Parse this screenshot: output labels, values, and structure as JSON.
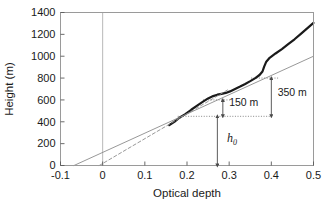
{
  "chart_data": {
    "type": "line",
    "title": "",
    "xlabel": "Optical depth",
    "ylabel": "Height (m)",
    "xlim": [
      -0.1,
      0.5
    ],
    "ylim": [
      0,
      1400
    ],
    "xticks": [
      -0.1,
      0,
      0.1,
      0.2,
      0.3,
      0.4,
      0.5
    ],
    "xtick_labels": [
      "-0.1",
      "0",
      "0.1",
      "0.2",
      "0.3",
      "0.4",
      "0.5"
    ],
    "yticks": [
      0,
      200,
      400,
      600,
      800,
      1000,
      1200,
      1400
    ],
    "ytick_labels": [
      "0",
      "200",
      "400",
      "600",
      "800",
      "1000",
      "1200",
      "1400"
    ],
    "grid": false,
    "legend": "none",
    "series": [
      {
        "name": "measured-profile",
        "style": "solid-thick-black",
        "color": "#1a1a1a",
        "points": [
          [
            0.158,
            370
          ],
          [
            0.17,
            400
          ],
          [
            0.182,
            437
          ],
          [
            0.196,
            470
          ],
          [
            0.21,
            510
          ],
          [
            0.224,
            548
          ],
          [
            0.238,
            585
          ],
          [
            0.25,
            614
          ],
          [
            0.262,
            635
          ],
          [
            0.272,
            648
          ],
          [
            0.282,
            656
          ],
          [
            0.292,
            664
          ],
          [
            0.302,
            678
          ],
          [
            0.314,
            700
          ],
          [
            0.326,
            722
          ],
          [
            0.338,
            746
          ],
          [
            0.35,
            772
          ],
          [
            0.362,
            800
          ],
          [
            0.372,
            828
          ],
          [
            0.379,
            860
          ],
          [
            0.383,
            905
          ],
          [
            0.388,
            950
          ],
          [
            0.396,
            985
          ],
          [
            0.41,
            1025
          ],
          [
            0.425,
            1065
          ],
          [
            0.44,
            1110
          ],
          [
            0.455,
            1155
          ],
          [
            0.47,
            1205
          ],
          [
            0.485,
            1255
          ],
          [
            0.5,
            1305
          ]
        ]
      },
      {
        "name": "fit-line-solid",
        "style": "solid-thin-gray",
        "color": "#8c8c8c",
        "points": [
          [
            -0.068,
            0
          ],
          [
            0.5,
            1000
          ]
        ]
      },
      {
        "name": "fit-line-dashed",
        "style": "dashed-thin-gray",
        "color": "#8c8c8c",
        "points": [
          [
            -0.008,
            0
          ],
          [
            0.3,
            700
          ]
        ]
      }
    ],
    "reference_lines": [
      {
        "name": "zero-vertical-gridline",
        "orientation": "vertical",
        "x": 0,
        "style": "solid-thin-gray",
        "color": "#b0b0b0"
      },
      {
        "name": "h0-baseline-dotted",
        "orientation": "horizontal",
        "y": 450,
        "x_from": 0.178,
        "x_to": 0.4,
        "style": "dotted",
        "color": "#7a7a7a"
      },
      {
        "name": "150m-upper-dotted",
        "orientation": "horizontal",
        "y": 600,
        "x_from": 0.238,
        "x_to": 0.302,
        "style": "dotted",
        "color": "#7a7a7a"
      },
      {
        "name": "350m-upper-dotted",
        "orientation": "horizontal",
        "y": 800,
        "x_from": 0.352,
        "x_to": 0.418,
        "style": "dotted",
        "color": "#7a7a7a"
      }
    ],
    "annotations": [
      {
        "name": "annotation-350m",
        "text": "350 m",
        "x": 0.415,
        "y": 640,
        "arrow_x": 0.4,
        "arrow_top": 800,
        "arrow_bottom": 450
      },
      {
        "name": "annotation-150m",
        "text": "150 m",
        "x": 0.3,
        "y": 545,
        "arrow_x": 0.285,
        "arrow_top": 600,
        "arrow_bottom": 450
      },
      {
        "name": "annotation-h0",
        "text": "h",
        "subscript": "0",
        "x": 0.295,
        "y": 215,
        "arrow_x": 0.272,
        "arrow_top": 450,
        "arrow_bottom": 0
      }
    ]
  }
}
